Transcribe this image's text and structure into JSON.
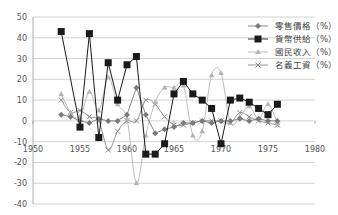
{
  "chart_data": {
    "type": "line",
    "title": "",
    "xlabel": "",
    "ylabel": "",
    "xlim": [
      1950,
      1980
    ],
    "ylim": [
      -40,
      50
    ],
    "x_ticks": [
      1950,
      1955,
      1960,
      1965,
      1970,
      1975,
      1980
    ],
    "y_ticks": [
      50,
      40,
      30,
      20,
      10,
      0,
      -10,
      -20,
      -30,
      -40
    ],
    "grid": "horizontal",
    "legend_position": "upper-right",
    "series": [
      {
        "name": "零售價格（%）",
        "marker": "diamond",
        "color": "#7a7a7a",
        "x": [
          1953,
          1954,
          1955,
          1956,
          1957,
          1958,
          1959,
          1960,
          1961,
          1962,
          1963,
          1964,
          1965,
          1966,
          1967,
          1968,
          1969,
          1970,
          1971,
          1972,
          1973,
          1974,
          1975,
          1976
        ],
        "values": [
          3,
          2,
          0,
          -1,
          1,
          0,
          0,
          3,
          16,
          3,
          -6,
          -4,
          -3,
          -1,
          -1,
          0,
          -1,
          0,
          0,
          1,
          0,
          1,
          0,
          0
        ]
      },
      {
        "name": "貨幣供給（%）",
        "marker": "square",
        "color": "#1a1a1a",
        "x": [
          1953,
          1955,
          1956,
          1957,
          1958,
          1959,
          1960,
          1961,
          1962,
          1963,
          1964,
          1965,
          1966,
          1967,
          1968,
          1969,
          1970,
          1971,
          1972,
          1973,
          1974,
          1975,
          1976
        ],
        "values": [
          43,
          -3,
          42,
          -8,
          28,
          10,
          27,
          31,
          -16,
          -16,
          -11,
          13,
          19,
          13,
          10,
          6,
          -11,
          10,
          11,
          9,
          6,
          3,
          8
        ]
      },
      {
        "name": "國民收入（%）",
        "marker": "triangle",
        "color": "#b5b5b5",
        "x": [
          1953,
          1954,
          1955,
          1956,
          1957,
          1958,
          1959,
          1960,
          1961,
          1962,
          1963,
          1964,
          1965,
          1966,
          1967,
          1968,
          1969,
          1970,
          1971,
          1972,
          1973,
          1974,
          1975,
          1976
        ],
        "values": [
          13,
          4,
          2,
          14,
          5,
          21,
          8,
          1,
          -30,
          -7,
          9,
          16,
          16,
          17,
          -7,
          -5,
          22,
          23,
          -1,
          2,
          7,
          1,
          8,
          -1
        ]
      },
      {
        "name": "名義工資（%）",
        "marker": "cross",
        "color": "#8a8a8a",
        "x": [
          1953,
          1954,
          1955,
          1956,
          1957,
          1958,
          1959,
          1960,
          1961,
          1962,
          1963,
          1964,
          1965,
          1966,
          1967,
          1968,
          1969,
          1970,
          1971,
          1972,
          1973,
          1974,
          1975,
          1976
        ],
        "values": [
          10,
          4,
          5,
          2,
          0,
          -14,
          -5,
          0,
          0,
          10,
          8,
          2,
          -2,
          -2,
          -1,
          0,
          0,
          0,
          -1,
          4,
          2,
          0,
          -1,
          -2
        ]
      }
    ]
  }
}
